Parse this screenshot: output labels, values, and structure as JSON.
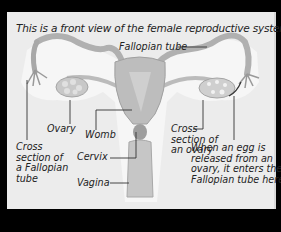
{
  "caption": "This is a front view of the female reproductive system.",
  "labels": {
    "fallopian_tube": "Fallopian tube",
    "ovary": "Ovary",
    "womb": "Womb",
    "cervix": "Cervix",
    "vagina": "Vagina",
    "cross_section_fallopian": [
      "Cross",
      "section of",
      "a Fallopian",
      "tube"
    ],
    "cross_section_ovary": [
      "Cross",
      "section of",
      "an ovary"
    ],
    "egg_release_note": [
      "When an egg is",
      "released from an",
      "ovary, it enters the",
      "Fallopian tube here."
    ]
  },
  "colors": {
    "background": "#000000",
    "panel": "#ececec",
    "organ": "#bdbdbd",
    "organ_dark": "#9a9a9a",
    "text": "#222222"
  }
}
